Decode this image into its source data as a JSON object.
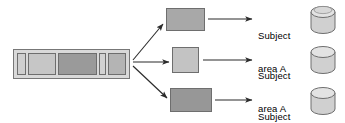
{
  "diagram": {
    "source": {
      "name": "source-data-bar",
      "segments": [
        {
          "id": "segment-1",
          "color": "#cfcfcf",
          "width": 9
        },
        {
          "id": "segment-2",
          "color": "#c6c6c6",
          "width": 28
        },
        {
          "id": "segment-3",
          "color": "#9a9a9a",
          "width": 39
        },
        {
          "id": "segment-4",
          "color": "#d2d2d2",
          "width": 7
        },
        {
          "id": "segment-5",
          "color": "#b4b4b4",
          "width": 22
        }
      ]
    },
    "branches": [
      {
        "box": {
          "id": "subject-box-1",
          "color": "#a8a8a8"
        },
        "label": "Subject\narea A",
        "label_line1": "Subject",
        "label_line2": "area A",
        "store": "database-cylinder-1"
      },
      {
        "box": {
          "id": "subject-box-2",
          "color": "#c3c3c3"
        },
        "label": "Subject\narea A",
        "label_line1": "Subject",
        "label_line2": "area A",
        "store": "database-cylinder-2"
      },
      {
        "box": {
          "id": "subject-box-3",
          "color": "#979797"
        },
        "label": "Subject\narea A",
        "label_line1": "Subject",
        "label_line2": "area A",
        "store": "database-cylinder-3"
      }
    ],
    "colors": {
      "background": "#ffffff",
      "stroke": "#6e6e6e",
      "arrow": "#2b2b2b",
      "text": "#000000",
      "bar_frame_fill": "#d9d9d9",
      "cylinder_fill": "#d0d0d0",
      "cylinder_top_fill": "#e3e3e3"
    },
    "arrows": [
      {
        "id": "arrow-split-up",
        "from": "source-data-bar",
        "to": "subject-box-1"
      },
      {
        "id": "arrow-split-middle",
        "from": "source-data-bar",
        "to": "subject-box-2"
      },
      {
        "id": "arrow-split-down",
        "from": "source-data-bar",
        "to": "subject-box-3"
      },
      {
        "id": "arrow-load-1",
        "from": "subject-box-1",
        "to": "database-cylinder-1"
      },
      {
        "id": "arrow-load-2",
        "from": "subject-box-2",
        "to": "database-cylinder-2"
      },
      {
        "id": "arrow-load-3",
        "from": "subject-box-3",
        "to": "database-cylinder-3"
      }
    ]
  }
}
